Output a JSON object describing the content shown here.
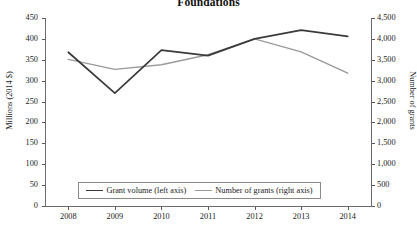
{
  "chart_data": {
    "type": "line",
    "title": "Foundations",
    "xlabel": "",
    "ylabel": "Millions (2014 $)",
    "y2label": "Number of grants",
    "categories": [
      "2008",
      "2009",
      "2010",
      "2011",
      "2012",
      "2013",
      "2014"
    ],
    "ylim": [
      0,
      450
    ],
    "y2lim": [
      0,
      4500
    ],
    "yticks": [
      "0",
      "50",
      "100",
      "150",
      "200",
      "250",
      "300",
      "350",
      "400",
      "450"
    ],
    "ytick_values": [
      0,
      50,
      100,
      150,
      200,
      250,
      300,
      350,
      400,
      450
    ],
    "y2ticks": [
      "0",
      "500",
      "1,000",
      "1,500",
      "2,000",
      "2,500",
      "3,000",
      "3,500",
      "4,000",
      "4,500"
    ],
    "y2tick_values": [
      0,
      500,
      1000,
      1500,
      2000,
      2500,
      3000,
      3500,
      4000,
      4500
    ],
    "grid": false,
    "legend_position": "bottom-center",
    "series": [
      {
        "name": "Grant volume (left axis)",
        "axis": "left",
        "color": "#3b3b3b",
        "values": [
          368,
          270,
          373,
          360,
          400,
          421,
          406
        ]
      },
      {
        "name": "Number of grants (right axis)",
        "axis": "right",
        "color": "#9a9a9a",
        "values": [
          3510,
          3270,
          3380,
          3620,
          4000,
          3690,
          3180
        ]
      }
    ]
  },
  "legend": {
    "items": [
      {
        "label": "Grant volume (left axis)"
      },
      {
        "label": "Number of grants (right axis)"
      }
    ]
  }
}
